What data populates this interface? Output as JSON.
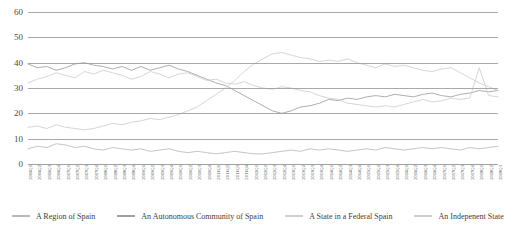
{
  "chart_data": {
    "type": "line",
    "title": "",
    "subtitle": "",
    "xlabel": "",
    "ylabel": "",
    "ylim": [
      0,
      60
    ],
    "yticks": [
      0,
      10,
      20,
      30,
      40,
      50,
      60
    ],
    "grid": true,
    "legend_position": "bottom",
    "x": [
      "2006Q1",
      "2006Q2",
      "2006Q3",
      "2006Q4",
      "2007Q1",
      "2007Q2",
      "2007Q3",
      "2007Q4",
      "2008Q1",
      "2008Q2",
      "2008Q3",
      "2008Q4",
      "2009Q1",
      "2009Q2",
      "2009Q3",
      "2009Q4",
      "2010Q1",
      "2010Q2",
      "2010Q3",
      "2010Q4",
      "2011Q1",
      "2011Q2",
      "2011Q3",
      "2011Q4",
      "2012Q1",
      "2012Q2",
      "2012Q3",
      "2012Q4",
      "2013Q1",
      "2013Q2",
      "2013Q3",
      "2013Q4",
      "2014Q1",
      "2014Q2",
      "2014Q3",
      "2014Q4",
      "2015Q1",
      "2015Q2",
      "2015Q3",
      "2015Q4",
      "2016Q1",
      "2016Q2",
      "2016Q3",
      "2016Q4",
      "2017Q1",
      "2017Q2",
      "2017Q3",
      "2017Q4",
      "2018Q1",
      "2018Q2",
      "2018Q3"
    ],
    "series": [
      {
        "name": "A Region of Spain",
        "color": "#b9b9b9",
        "values": [
          6.0,
          7.0,
          6.5,
          8.0,
          7.5,
          6.5,
          7.0,
          6.0,
          5.5,
          6.5,
          6.0,
          5.5,
          6.0,
          5.0,
          5.5,
          6.0,
          5.0,
          4.5,
          5.0,
          4.5,
          4.0,
          4.5,
          5.0,
          4.5,
          4.0,
          4.0,
          4.5,
          5.0,
          5.5,
          5.0,
          6.0,
          5.5,
          6.0,
          5.5,
          5.0,
          5.5,
          6.0,
          5.5,
          6.5,
          6.0,
          5.5,
          6.0,
          6.5,
          6.0,
          6.5,
          6.0,
          5.5,
          6.5,
          6.0,
          6.5,
          7.0
        ]
      },
      {
        "name": "An Autonomous Community of Spain",
        "color": "#9f9f9f",
        "values": [
          39.5,
          38.0,
          38.5,
          37.0,
          38.0,
          39.5,
          40.0,
          39.0,
          38.5,
          37.5,
          38.5,
          37.0,
          38.5,
          37.0,
          38.0,
          39.0,
          37.5,
          36.5,
          35.0,
          33.5,
          32.0,
          31.0,
          29.0,
          27.0,
          25.0,
          23.0,
          21.0,
          20.0,
          21.0,
          22.5,
          23.0,
          24.0,
          25.5,
          25.0,
          26.0,
          25.5,
          26.5,
          27.0,
          26.5,
          27.5,
          27.0,
          26.5,
          27.5,
          28.0,
          27.0,
          26.5,
          27.5,
          28.0,
          29.0,
          28.5,
          29.0
        ]
      },
      {
        "name": "A State in a Federal Spain",
        "color": "#cfcfcf",
        "values": [
          32.0,
          33.5,
          34.5,
          36.0,
          35.0,
          34.0,
          36.5,
          35.5,
          37.0,
          36.0,
          35.0,
          33.5,
          34.5,
          36.5,
          35.5,
          34.0,
          35.5,
          36.0,
          34.5,
          33.0,
          33.5,
          32.0,
          31.5,
          32.5,
          31.0,
          30.0,
          29.5,
          30.5,
          30.0,
          29.0,
          28.5,
          27.0,
          26.0,
          25.5,
          24.0,
          23.5,
          23.0,
          22.5,
          23.0,
          22.5,
          23.5,
          24.5,
          25.5,
          24.5,
          25.0,
          26.0,
          25.5,
          26.0,
          38.0,
          27.0,
          26.5
        ]
      },
      {
        "name": "An Indepenent State",
        "color": "#cdcdcd",
        "values": [
          14.5,
          15.0,
          14.0,
          15.5,
          14.5,
          14.0,
          13.5,
          14.0,
          15.0,
          16.0,
          15.5,
          16.5,
          17.0,
          18.0,
          17.5,
          18.5,
          19.5,
          21.0,
          22.5,
          25.0,
          27.5,
          30.0,
          33.0,
          36.5,
          39.5,
          41.5,
          43.5,
          44.0,
          43.0,
          42.0,
          41.5,
          40.5,
          41.0,
          40.5,
          41.5,
          40.0,
          39.0,
          38.0,
          39.5,
          38.5,
          39.0,
          38.0,
          37.0,
          36.5,
          37.5,
          38.0,
          36.0,
          34.0,
          32.0,
          30.5,
          29.0
        ]
      }
    ]
  },
  "legend": {
    "items": [
      {
        "label": "A Region of Spain",
        "color": "#b9b9b9"
      },
      {
        "label": "An Autonomous Community of Spain",
        "color": "#9f9f9f"
      },
      {
        "label": "A State in a Federal Spain",
        "color": "#cfcfcf"
      },
      {
        "label": "An Indepenent State",
        "color": "#cdcdcd"
      }
    ]
  },
  "colors": {
    "background": "#ffffff",
    "gridline": "#9a9a9a",
    "axis_text": "#4a4a4a"
  }
}
